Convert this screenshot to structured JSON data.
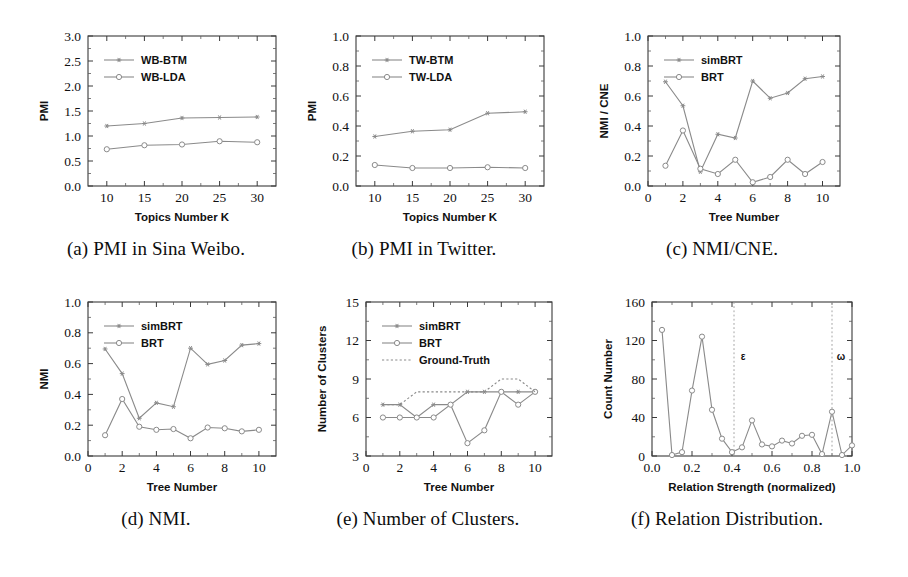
{
  "figure": {
    "background": "#ffffff",
    "line_color": "#8a8a8a",
    "text_color": "#111111"
  },
  "panels": [
    {
      "id": "a",
      "caption": "(a) PMI in Sina Weibo.",
      "chart_data": {
        "type": "line",
        "title": "",
        "xlabel": "Topics Number K",
        "ylabel": "PMI",
        "x": [
          10,
          15,
          20,
          25,
          30
        ],
        "xlim": [
          7.5,
          32.5
        ],
        "ylim": [
          0.0,
          3.0
        ],
        "xticks": [
          10,
          15,
          20,
          25,
          30
        ],
        "xticklabels": [
          "10",
          "15",
          "20",
          "25",
          "30"
        ],
        "yticks": [
          0.0,
          0.5,
          1.0,
          1.5,
          2.0,
          2.5,
          3.0
        ],
        "yticklabels": [
          "0.0",
          "0.5",
          "1.0",
          "1.5",
          "2.0",
          "2.5",
          "3.0"
        ],
        "grid": false,
        "legend_position": "upper-left",
        "series": [
          {
            "name": "WB-BTM",
            "marker": "star",
            "style": "solid",
            "values": [
              1.2,
              1.25,
              1.36,
              1.37,
              1.38
            ]
          },
          {
            "name": "WB-LDA",
            "marker": "circle",
            "style": "solid",
            "values": [
              0.735,
              0.815,
              0.83,
              0.895,
              0.875
            ]
          }
        ]
      }
    },
    {
      "id": "b",
      "caption": "(b) PMI in Twitter.",
      "chart_data": {
        "type": "line",
        "title": "",
        "xlabel": "Topics Number K",
        "ylabel": "PMI",
        "x": [
          10,
          15,
          20,
          25,
          30
        ],
        "xlim": [
          7.5,
          32.5
        ],
        "ylim": [
          0.0,
          1.0
        ],
        "xticks": [
          10,
          15,
          20,
          25,
          30
        ],
        "xticklabels": [
          "10",
          "15",
          "20",
          "25",
          "30"
        ],
        "yticks": [
          0.0,
          0.2,
          0.4,
          0.6,
          0.8,
          1.0
        ],
        "yticklabels": [
          "0.0",
          "0.2",
          "0.4",
          "0.6",
          "0.8",
          "1.0"
        ],
        "grid": false,
        "legend_position": "upper-left",
        "series": [
          {
            "name": "TW-BTM",
            "marker": "star",
            "style": "solid",
            "values": [
              0.33,
              0.365,
              0.375,
              0.485,
              0.495
            ]
          },
          {
            "name": "TW-LDA",
            "marker": "circle",
            "style": "solid",
            "values": [
              0.14,
              0.12,
              0.12,
              0.125,
              0.12
            ]
          }
        ]
      }
    },
    {
      "id": "c",
      "caption": "(c) NMI/CNE.",
      "chart_data": {
        "type": "line",
        "title": "",
        "xlabel": "Tree Number",
        "ylabel": "NMI / CNE",
        "x": [
          1,
          2,
          3,
          4,
          5,
          6,
          7,
          8,
          9,
          10
        ],
        "xlim": [
          0,
          11
        ],
        "ylim": [
          0.0,
          1.0
        ],
        "xticks": [
          0,
          2,
          4,
          6,
          8,
          10
        ],
        "xticklabels": [
          "0",
          "2",
          "4",
          "6",
          "8",
          "10"
        ],
        "yticks": [
          0.0,
          0.2,
          0.4,
          0.6,
          0.8,
          1.0
        ],
        "yticklabels": [
          "0.0",
          "0.2",
          "0.4",
          "0.6",
          "0.8",
          "1.0"
        ],
        "grid": false,
        "legend_position": "upper-left",
        "series": [
          {
            "name": "simBRT",
            "marker": "star",
            "style": "solid",
            "values": [
              0.695,
              0.535,
              0.095,
              0.345,
              0.32,
              0.7,
              0.585,
              0.62,
              0.715,
              0.73
            ]
          },
          {
            "name": "BRT",
            "marker": "circle",
            "style": "solid",
            "values": [
              0.135,
              0.37,
              0.115,
              0.08,
              0.175,
              0.025,
              0.06,
              0.175,
              0.08,
              0.16
            ]
          }
        ]
      }
    },
    {
      "id": "d",
      "caption": "(d) NMI.",
      "chart_data": {
        "type": "line",
        "title": "",
        "xlabel": "Tree Number",
        "ylabel": "NMI",
        "x": [
          1,
          2,
          3,
          4,
          5,
          6,
          7,
          8,
          9,
          10
        ],
        "xlim": [
          0,
          11
        ],
        "ylim": [
          0.0,
          1.0
        ],
        "xticks": [
          0,
          2,
          4,
          6,
          8,
          10
        ],
        "xticklabels": [
          "0",
          "2",
          "4",
          "6",
          "8",
          "10"
        ],
        "yticks": [
          0.0,
          0.2,
          0.4,
          0.6,
          0.8,
          1.0
        ],
        "yticklabels": [
          "0.0",
          "0.2",
          "0.4",
          "0.6",
          "0.8",
          "1.0"
        ],
        "grid": false,
        "legend_position": "upper-left",
        "series": [
          {
            "name": "simBRT",
            "marker": "star",
            "style": "solid",
            "values": [
              0.695,
              0.535,
              0.245,
              0.345,
              0.32,
              0.7,
              0.595,
              0.62,
              0.72,
              0.73
            ]
          },
          {
            "name": "BRT",
            "marker": "circle",
            "style": "solid",
            "values": [
              0.135,
              0.37,
              0.19,
              0.17,
              0.175,
              0.115,
              0.185,
              0.18,
              0.16,
              0.17
            ]
          }
        ]
      }
    },
    {
      "id": "e",
      "caption": "(e) Number of Clusters.",
      "chart_data": {
        "type": "line",
        "title": "",
        "xlabel": "Tree Number",
        "ylabel": "Number of Clusters",
        "x": [
          1,
          2,
          3,
          4,
          5,
          6,
          7,
          8,
          9,
          10
        ],
        "xlim": [
          0,
          11
        ],
        "ylim": [
          3,
          15
        ],
        "xticks": [
          0,
          2,
          4,
          6,
          8,
          10
        ],
        "xticklabels": [
          "0",
          "2",
          "4",
          "6",
          "8",
          "10"
        ],
        "yticks": [
          3,
          6,
          9,
          12,
          15
        ],
        "yticklabels": [
          "3",
          "6",
          "9",
          "12",
          "15"
        ],
        "grid": false,
        "legend_position": "upper-left",
        "series": [
          {
            "name": "simBRT",
            "marker": "star",
            "style": "solid",
            "values": [
              7,
              7,
              6,
              7,
              7,
              8,
              8,
              8,
              8,
              8
            ]
          },
          {
            "name": "BRT",
            "marker": "circle",
            "style": "solid",
            "values": [
              6,
              6,
              6,
              6,
              7,
              4,
              5,
              8,
              7,
              8
            ]
          },
          {
            "name": "Ground-Truth",
            "marker": "none",
            "style": "dotted",
            "values": [
              7,
              7,
              8,
              8,
              8,
              8,
              8,
              9,
              9,
              8
            ]
          }
        ]
      }
    },
    {
      "id": "f",
      "caption": "(f) Relation Distribution.",
      "chart_data": {
        "type": "line",
        "title": "",
        "xlabel": "Relation Strength (normalized)",
        "ylabel": "Count Number",
        "x": [
          0.05,
          0.1,
          0.15,
          0.2,
          0.25,
          0.3,
          0.35,
          0.4,
          0.45,
          0.5,
          0.55,
          0.6,
          0.65,
          0.7,
          0.75,
          0.8,
          0.85,
          0.9,
          0.95,
          1.0
        ],
        "xlim": [
          0.0,
          1.0
        ],
        "ylim": [
          0,
          160
        ],
        "xticks": [
          0.0,
          0.2,
          0.4,
          0.6,
          0.8,
          1.0
        ],
        "xticklabels": [
          "0.0",
          "0.2",
          "0.4",
          "0.6",
          "0.8",
          "1.0"
        ],
        "yticks": [
          0,
          40,
          80,
          120,
          160
        ],
        "yticklabels": [
          "0",
          "40",
          "80",
          "120",
          "160"
        ],
        "grid": false,
        "legend_position": "none",
        "series": [
          {
            "name": "Relation count",
            "marker": "circle",
            "style": "solid",
            "values": [
              131,
              1,
              4,
              68,
              124,
              48,
              18,
              4,
              9,
              37,
              12,
              10,
              16,
              13,
              21,
              22,
              2,
              46,
              1,
              11
            ]
          }
        ],
        "annotations": [
          {
            "label": "ε",
            "x": 0.41,
            "type": "vline-dotted",
            "label_y": 100
          },
          {
            "label": "ω",
            "x": 0.9,
            "type": "vline-dotted",
            "label_y": 100
          }
        ]
      }
    }
  ]
}
